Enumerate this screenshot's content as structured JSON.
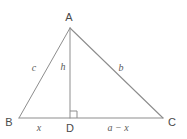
{
  "figure": {
    "name": "right-triangle-with-altitude",
    "background_color": "#ffffff",
    "stroke_color": "#8d8d8d",
    "vertex_text_color": "#4a4a4a",
    "side_text_color": "#5a5a5a",
    "vertices": [
      {
        "id": "A",
        "label": "A",
        "x": 70,
        "y": 28,
        "label_x": 69,
        "label_y": 17
      },
      {
        "id": "B",
        "label": "B",
        "x": 19,
        "y": 118,
        "label_x": 9,
        "label_y": 122
      },
      {
        "id": "C",
        "label": "C",
        "x": 163,
        "y": 118,
        "label_x": 172,
        "label_y": 122
      },
      {
        "id": "D",
        "label": "D",
        "x": 70,
        "y": 118,
        "label_x": 70,
        "label_y": 128
      }
    ],
    "segments": [
      {
        "id": "AB",
        "from": "A",
        "to": "B",
        "label": "c",
        "label_x": 34,
        "label_y": 68
      },
      {
        "id": "AC",
        "from": "A",
        "to": "C",
        "label": "b",
        "label_x": 121,
        "label_y": 68
      },
      {
        "id": "AD",
        "from": "A",
        "to": "D",
        "label": "h",
        "label_x": 63,
        "label_y": 67
      },
      {
        "id": "BD",
        "from": "B",
        "to": "D",
        "label": "x",
        "label_x": 39,
        "label_y": 128
      },
      {
        "id": "DC",
        "from": "D",
        "to": "C",
        "label": "a − x",
        "label_x": 118,
        "label_y": 128
      }
    ],
    "right_angle": {
      "at": "D",
      "size": 7,
      "orientation": "up-right"
    }
  }
}
